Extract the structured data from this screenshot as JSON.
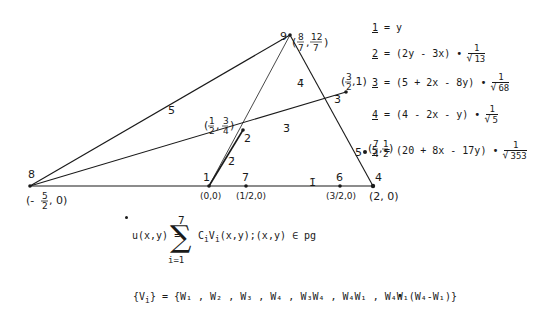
{
  "diagram": {
    "nodes": [
      {
        "id": "8",
        "label": "8",
        "coord": "(-5/2, 0)"
      },
      {
        "id": "1",
        "label": "1",
        "coord": "(0,0)"
      },
      {
        "id": "7",
        "label": "7",
        "coord": "(1/2,0)"
      },
      {
        "id": "6",
        "label": "6",
        "coord": "(3/2,0)"
      },
      {
        "id": "4",
        "label": "4",
        "coord": "(2,0)"
      },
      {
        "id": "2",
        "label": "2",
        "coord": "(1/2, 3/4)"
      },
      {
        "id": "3",
        "label": "3",
        "coord": "(3/2,1)"
      },
      {
        "id": "5",
        "label": "5",
        "coord": "(7/4,1/2)"
      },
      {
        "id": "9",
        "label": "9",
        "coord": "(8/7, 12/7)"
      }
    ],
    "edge_labels": {
      "e1": "1̄",
      "e2": "2̄",
      "e3": "3̄",
      "e4": "4̄",
      "e5": "5̄"
    },
    "coord_text": {
      "n8_pre": "(-",
      "n8_num": "5",
      "n8_den": "2",
      "n8_post": ", 0)",
      "n1": "(0,0)",
      "n7": "(1/2,0)",
      "n6": "(3/2,0)",
      "n4": "(2, 0)",
      "n2_num1": "1",
      "n2_den1": "2",
      "n2_num2": "3",
      "n2_den2": "4",
      "n3_num": "3",
      "n3_den": "2",
      "n3_tail": ",1)",
      "n5_num1": "7",
      "n5_den1": "4",
      "n5_num2": "1",
      "n5_den2": "2",
      "n9_num1": "8",
      "n9_den1": "7",
      "n9_num2": "12",
      "n9_den2": "7"
    }
  },
  "line_equations": [
    {
      "index": "1",
      "expr": "= y",
      "root": ""
    },
    {
      "index": "2",
      "expr": "= (2y - 3x) •",
      "root": "13"
    },
    {
      "index": "3",
      "expr": "= (5 + 2x - 8y) •",
      "root": "68"
    },
    {
      "index": "4",
      "expr": "= (4 - 2x - y) •",
      "root": "5"
    },
    {
      "index": "5",
      "expr": "= (20 + 8x - 17y) •",
      "root": "353"
    }
  ],
  "fraction_numerator": "1",
  "formula_u": {
    "lhs": "u(x,y) =",
    "upper_limit": "7",
    "sigma": "∑",
    "lower_limit": "i=1",
    "body": "C",
    "sub_i": "i",
    "v": "V",
    "sub_i2": "i",
    "tail": "(x,y);(x,y) ∈ pg"
  },
  "formula_v": {
    "lhs": "{V",
    "lhs_sub": "i",
    "lhs_close": "} = {W₁ , W₂ , W₃ , W₄ , W₃W₄ , W₄W₁ , W₄W₁(W₄-W₁)}",
    "trailing": "•"
  }
}
